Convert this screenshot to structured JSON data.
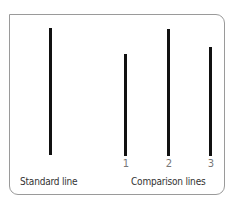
{
  "colors": {
    "line": "#111111",
    "border": "#9a9a9a",
    "number": "#777777",
    "label": "#333333"
  },
  "standard": {
    "label": "Standard line",
    "line": {
      "x": 49,
      "top": 28,
      "bottom": 155
    }
  },
  "comparison": {
    "label": "Comparison lines",
    "lines": [
      {
        "number": "1",
        "x": 124,
        "top": 54,
        "bottom": 156
      },
      {
        "number": "2",
        "x": 167,
        "top": 29,
        "bottom": 156
      },
      {
        "number": "3",
        "x": 209,
        "top": 47,
        "bottom": 156
      }
    ]
  }
}
